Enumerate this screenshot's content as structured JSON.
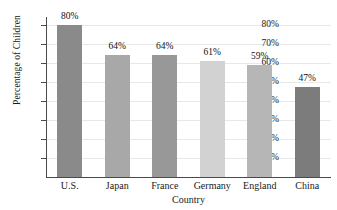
{
  "chart_data": {
    "type": "bar",
    "title": "",
    "xlabel": "Country",
    "ylabel": "Percentage of Children",
    "categories": [
      "U.S.",
      "Japan",
      "France",
      "Germany",
      "England",
      "China"
    ],
    "values": [
      80,
      64,
      64,
      61,
      59,
      47
    ],
    "value_labels": [
      "80%",
      "64%",
      "64%",
      "61%",
      "59%",
      "47%"
    ],
    "ylim": [
      0,
      84
    ],
    "ytick_values": [
      10,
      20,
      30,
      40,
      50,
      60,
      70,
      80
    ],
    "ytick_labels": [
      "10%",
      "20%",
      "30%",
      "40%",
      "50%",
      "60%",
      "70%",
      "80%"
    ],
    "grid": "horizontal",
    "legend": "none",
    "bar_colors": [
      "#8a8a8a",
      "#a8a8a8",
      "#989898",
      "#d2d2d2",
      "#b6b6b6",
      "#7c7c7c"
    ],
    "axis_color": "#4a4a4a",
    "gridline_color": "#e8e8e8",
    "background": "#ffffff"
  }
}
